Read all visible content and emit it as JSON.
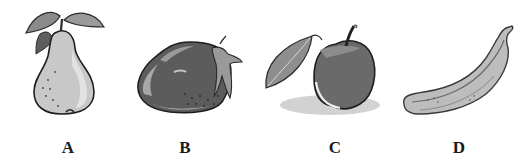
{
  "figure": {
    "items": [
      {
        "label": "A",
        "fruit": "pear",
        "icon": "pear-icon"
      },
      {
        "label": "B",
        "fruit": "strawberry",
        "icon": "strawberry-icon"
      },
      {
        "label": "C",
        "fruit": "apple",
        "icon": "apple-icon"
      },
      {
        "label": "D",
        "fruit": "banana",
        "icon": "banana-icon"
      }
    ]
  }
}
